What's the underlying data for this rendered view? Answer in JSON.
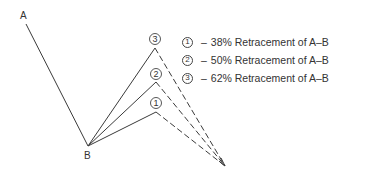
{
  "diagram": {
    "points": {
      "A": {
        "label": "A",
        "x": 26,
        "y": 24
      },
      "B": {
        "label": "B",
        "x": 88,
        "y": 146
      }
    },
    "peaks": [
      {
        "id": "1",
        "symbol": "1",
        "x": 156,
        "y": 112
      },
      {
        "id": "2",
        "symbol": "2",
        "x": 156,
        "y": 82
      },
      {
        "id": "3",
        "symbol": "3",
        "x": 155,
        "y": 48
      }
    ],
    "convergence": {
      "x": 225,
      "y": 166
    }
  },
  "legend": {
    "items": [
      {
        "symbol": "1",
        "dash": "–",
        "text": "38% Retracement of A–B"
      },
      {
        "symbol": "2",
        "dash": "–",
        "text": "50% Retracement of A–B"
      },
      {
        "symbol": "3",
        "dash": "–",
        "text": "62% Retracement of A–B"
      }
    ]
  },
  "colors": {
    "line": "#3a3a3a",
    "background": "#ffffff"
  }
}
